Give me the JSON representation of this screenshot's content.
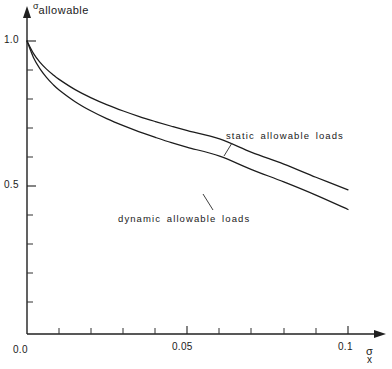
{
  "chart_data": {
    "type": "line",
    "title": "",
    "subtitle": "",
    "xlabel": "σx",
    "ylabel": "σallowable",
    "xlim": [
      0,
      0.112
    ],
    "ylim": [
      0,
      1.06
    ],
    "grid": false,
    "legend_position": "inline-annotation",
    "x_ticks": [
      0.0,
      0.01,
      0.02,
      0.03,
      0.04,
      0.05,
      0.06,
      0.07,
      0.08,
      0.09,
      0.1
    ],
    "x_tick_labels": [
      "0.0",
      "",
      "",
      "",
      "",
      "0.05",
      "",
      "",
      "",
      "",
      "0.1"
    ],
    "y_ticks": [
      0.0,
      0.1,
      0.2,
      0.3,
      0.4,
      0.5,
      0.6,
      0.7,
      0.8,
      0.9,
      1.0
    ],
    "y_tick_labels": [
      "",
      "",
      "",
      "",
      "",
      "0.5",
      "",
      "",
      "",
      "",
      "1.0"
    ],
    "x": [
      0.0,
      0.002,
      0.004,
      0.006,
      0.008,
      0.01,
      0.015,
      0.02,
      0.025,
      0.03,
      0.035,
      0.04,
      0.045,
      0.05,
      0.06,
      0.07,
      0.08,
      0.09,
      0.1
    ],
    "series": [
      {
        "name": "static allowable loads",
        "values": [
          1.0,
          0.958,
          0.928,
          0.905,
          0.886,
          0.869,
          0.834,
          0.806,
          0.782,
          0.761,
          0.742,
          0.725,
          0.709,
          0.694,
          0.666,
          0.62,
          0.58,
          0.535,
          0.492
        ]
      },
      {
        "name": "dynamic allowable loads",
        "values": [
          1.0,
          0.944,
          0.906,
          0.877,
          0.853,
          0.833,
          0.793,
          0.761,
          0.734,
          0.711,
          0.69,
          0.671,
          0.653,
          0.637,
          0.607,
          0.561,
          0.519,
          0.474,
          0.425
        ]
      }
    ],
    "annotations": [
      {
        "text": "static allowable loads",
        "series": "static allowable loads",
        "leader": true
      },
      {
        "text": "dynamic allowable loads",
        "series": "dynamic allowable loads",
        "leader": true
      }
    ]
  },
  "axes": {
    "y_title_symbol": "σ",
    "y_title_subscript": "allowable",
    "x_title_symbol": "σ",
    "x_title_subscript": "x",
    "y_label_one": "1.0",
    "y_label_half": "0.5",
    "x_label_zero": "0.0",
    "x_label_mid": "0.05",
    "x_label_max": "0.1"
  },
  "annotations": {
    "static": "static allowable loads",
    "dynamic": "dynamic allowable loads"
  },
  "colors": {
    "curve": "#1c1c1c",
    "axis": "#202020",
    "background": "#ffffff"
  }
}
